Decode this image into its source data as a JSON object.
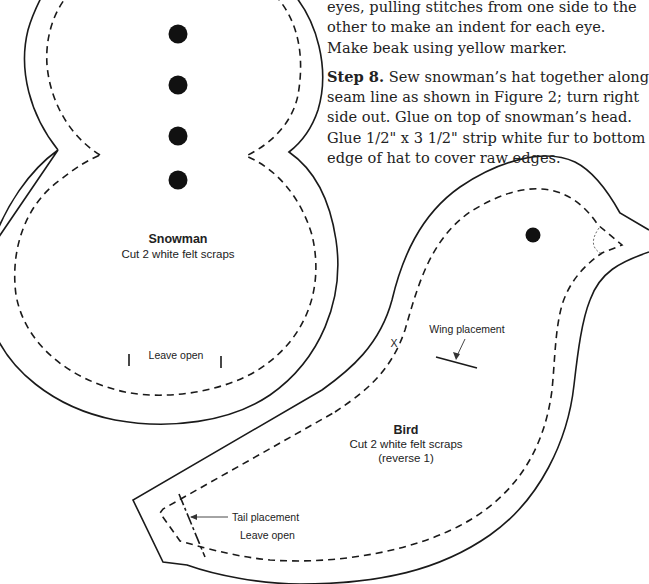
{
  "instructions": {
    "step7_tail": "eyes, pulling stitches from one side to the other to make an indent for each eye. Make beak using yellow marker.",
    "step8": {
      "label": "Step 8.",
      "text": " Sew snowman’s hat together along seam line as shown in Figure 2; turn right side out. Glue on top of snowman’s head. Glue 1/2\" x 3 1/2\" strip white fur to bottom edge of hat to cover raw edges."
    }
  },
  "snowman_pattern": {
    "title": "Snowman",
    "cut_instruction": "Cut 2 white felt scraps",
    "opening_label": "Leave open",
    "button_count": 4
  },
  "bird_pattern": {
    "title": "Bird",
    "cut_instruction": "Cut 2 white felt scraps",
    "reverse_note": "(reverse 1)",
    "wing_label": "Wing placement",
    "tail_label": "Tail placement",
    "opening_label": "Leave open",
    "x_mark": "X"
  },
  "colors": {
    "line": "#1a1a1a",
    "background": "#ffffff"
  }
}
